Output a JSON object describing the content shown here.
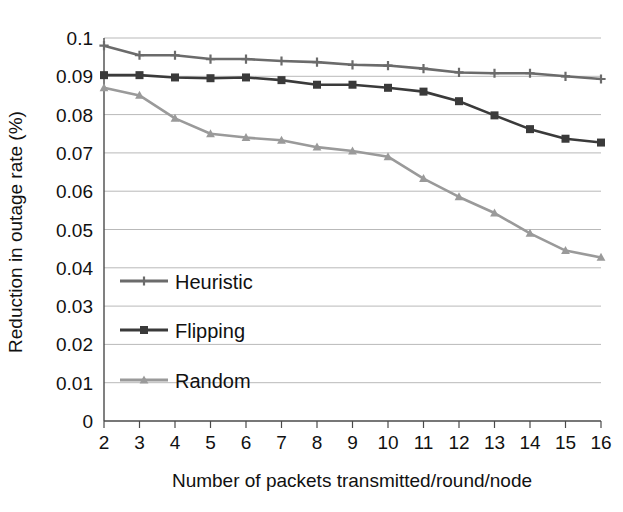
{
  "chart_data": {
    "type": "line",
    "title": "",
    "subtitle": "",
    "xlabel": "Number of packets transmitted/round/node",
    "ylabel": "Reduction in outage rate (%)",
    "x": [
      2,
      3,
      4,
      5,
      6,
      7,
      8,
      9,
      10,
      11,
      12,
      13,
      14,
      15,
      16
    ],
    "xtick_labels": [
      "2",
      "3",
      "4",
      "5",
      "6",
      "7",
      "8",
      "9",
      "10",
      "11",
      "12",
      "13",
      "14",
      "15",
      "16"
    ],
    "ytick_labels": [
      "0",
      "0.01",
      "0.02",
      "0.03",
      "0.04",
      "0.05",
      "0.06",
      "0.07",
      "0.08",
      "0.09",
      "0.1"
    ],
    "ytick_values": [
      0,
      0.01,
      0.02,
      0.03,
      0.04,
      0.05,
      0.06,
      0.07,
      0.08,
      0.09,
      0.1
    ],
    "xlim": [
      2,
      16
    ],
    "ylim": [
      0,
      0.1
    ],
    "grid": "horizontal",
    "legend_position": "inside-lower-left",
    "series": [
      {
        "name": "Heuristic",
        "color": "#6b6b6b",
        "marker": "cross",
        "values": [
          0.098,
          0.0955,
          0.0955,
          0.0945,
          0.0945,
          0.094,
          0.0937,
          0.093,
          0.0928,
          0.092,
          0.091,
          0.0908,
          0.0908,
          0.09,
          0.0893
        ]
      },
      {
        "name": "Flipping",
        "color": "#3a3a3a",
        "marker": "square",
        "values": [
          0.0903,
          0.0903,
          0.0897,
          0.0895,
          0.0897,
          0.089,
          0.0878,
          0.0878,
          0.087,
          0.086,
          0.0835,
          0.0798,
          0.0762,
          0.0737,
          0.0727
        ]
      },
      {
        "name": "Random",
        "color": "#9a9a9a",
        "marker": "triangle",
        "values": [
          0.087,
          0.085,
          0.079,
          0.075,
          0.074,
          0.0733,
          0.0715,
          0.0705,
          0.069,
          0.0633,
          0.0585,
          0.0543,
          0.049,
          0.0445,
          0.0427
        ]
      }
    ]
  },
  "legend": {
    "items": [
      {
        "label": "Heuristic"
      },
      {
        "label": "Flipping"
      },
      {
        "label": "Random"
      }
    ]
  },
  "colors": {
    "axis": "#4a4a4a",
    "grid": "#b9b9b9",
    "text": "#111111",
    "heuristic": "#6b6b6b",
    "flipping": "#3a3a3a",
    "random": "#9a9a9a"
  }
}
